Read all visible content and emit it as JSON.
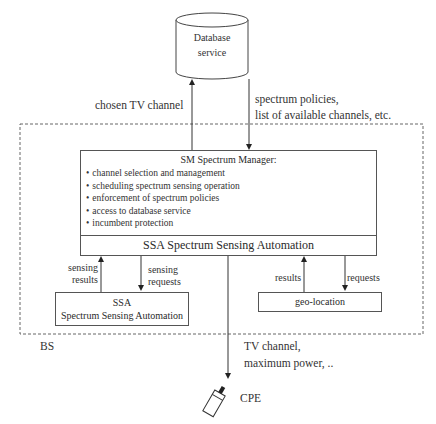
{
  "database": {
    "line1": "Database",
    "line2": "service"
  },
  "arrows": {
    "up_to_db": "chosen TV channel",
    "down_from_db_line1": "spectrum policies,",
    "down_from_db_line2": "list of available channels, etc.",
    "ssa_up_line1": "sensing",
    "ssa_up_line2": "results",
    "ssa_down_line1": "sensing",
    "ssa_down_line2": "requests",
    "geo_up": "results",
    "geo_down": "requests",
    "cpe_line1": "TV channel,",
    "cpe_line2": "maximum power, .."
  },
  "sm_box": {
    "title": "SM Spectrum Manager:",
    "items": [
      "channel selection and management",
      "scheduling spectrum sensing operation",
      "enforcement of spectrum policies",
      "access to database service",
      "incumbent protection"
    ],
    "footer": "SSA Spectrum Sensing Automation"
  },
  "ssa_box": {
    "line1": "SSA",
    "line2": "Spectrum Sensing Automation"
  },
  "geo_box": {
    "label": "geo-location"
  },
  "bs_label": "BS",
  "cpe_label": "CPE"
}
